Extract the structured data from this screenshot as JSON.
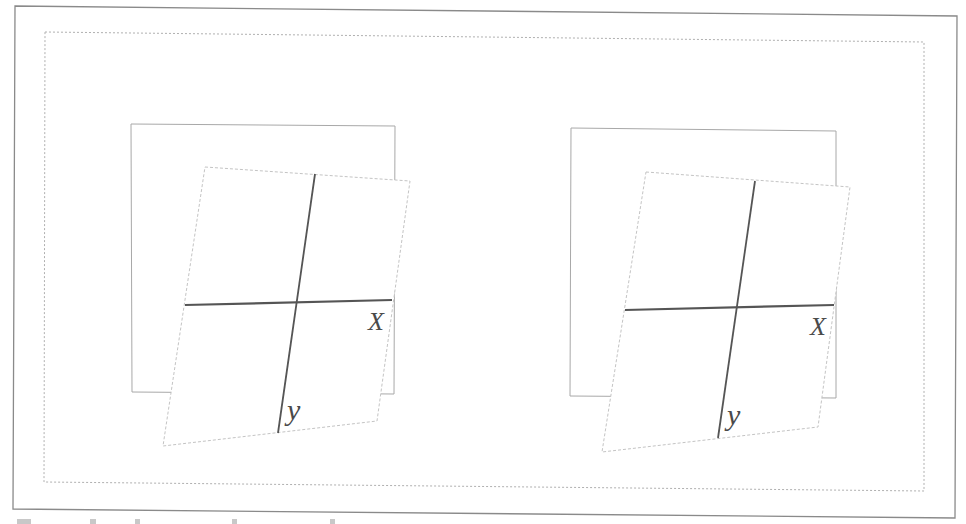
{
  "figure": {
    "colors": {
      "background": "#ffffff",
      "outer_frame": "#8a8a8a",
      "inner_dotted_frame": "#b0b0b0",
      "square_frame": "#a8a8a8",
      "tilted_plane": "#c4c4c4",
      "axis_line": "#555555",
      "axis_label": "#4a4a4a"
    },
    "panels": [
      {
        "id": "left",
        "x_axis_label": "X",
        "y_axis_label": "y"
      },
      {
        "id": "right",
        "x_axis_label": "X",
        "y_axis_label": "y"
      }
    ],
    "caption": {
      "visible": "truncated",
      "text": ""
    }
  }
}
